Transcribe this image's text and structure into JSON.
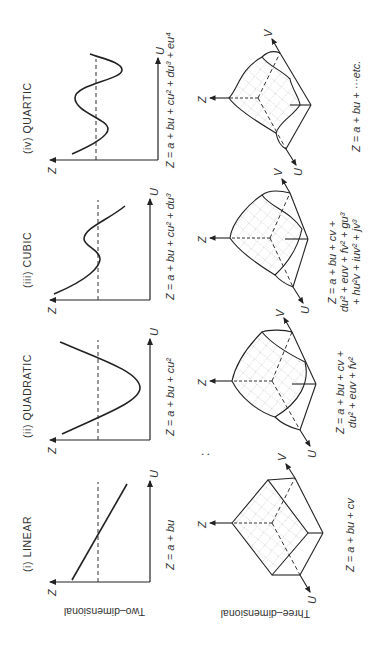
{
  "figure": {
    "orientation": "rotated 90 degrees counter-clockwise",
    "row_labels": {
      "two_d": "Two–dimensional",
      "three_d": "Three–dimensional"
    },
    "separator": ":",
    "axis_labels": {
      "z": "Z",
      "u": "U",
      "v": "V"
    },
    "panels": [
      {
        "id": "linear",
        "title": "(i)  LINEAR",
        "eq2d": [
          "Z = a + bu"
        ],
        "eq3d": [
          "Z = a + bu + cv"
        ]
      },
      {
        "id": "quadratic",
        "title": "(ii)  QUADRATIC",
        "eq2d": [
          "Z = a + bu + cu²"
        ],
        "eq3d": [
          "Z = a + bu + cv +",
          "du² + euv + fv²"
        ]
      },
      {
        "id": "cubic",
        "title": "(iii)  CUBIC",
        "eq2d": [
          "Z = a + bu + cu² + du³"
        ],
        "eq3d": [
          "Z = a + bu + cv +",
          "du² + euv + fv² + gu³",
          "+ hu²v + iuv² + jv³"
        ]
      },
      {
        "id": "quartic",
        "title": "(iv)  QUARTIC",
        "eq2d": [
          "Z = a + bu + cu² + du³ + eu⁴"
        ],
        "eq3d": [
          "Z = a + bu + ···etc."
        ]
      }
    ]
  }
}
